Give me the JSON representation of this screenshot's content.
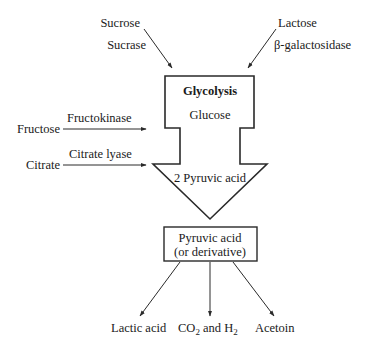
{
  "diagram": {
    "type": "metabolic-pathway",
    "central_block": {
      "title": "Glycolysis",
      "input": "Glucose",
      "output": "2 Pyruvic acid"
    },
    "inputs": [
      {
        "substrate": "Sucrose",
        "enzyme": "Sucrase"
      },
      {
        "substrate": "Lactose",
        "enzyme": "β-galactosidase"
      },
      {
        "substrate": "Fructose",
        "enzyme": "Fructokinase"
      },
      {
        "substrate": "Citrate",
        "enzyme": "Citrate lyase"
      }
    ],
    "intermediate": {
      "line1": "Pyruvic acid",
      "line2": "(or derivative)"
    },
    "products": [
      {
        "label": "Lactic acid"
      },
      {
        "label_parts": [
          "CO",
          "2",
          " and H",
          "2"
        ]
      },
      {
        "label": "Acetoin"
      }
    ]
  },
  "colors": {
    "line": "#2a2a2a",
    "background": "#ffffff"
  }
}
